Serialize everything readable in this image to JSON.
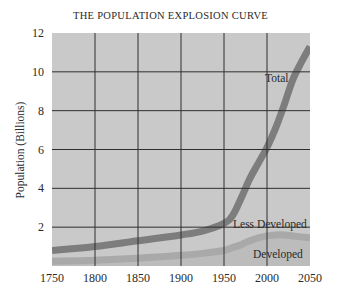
{
  "chart_data": {
    "type": "line",
    "title": "THE POPULATION EXPLOSION CURVE",
    "xlabel": "",
    "ylabel": "Population (Billions)",
    "xlim": [
      1750,
      2050
    ],
    "ylim": [
      0,
      12
    ],
    "x_ticks": [
      1750,
      1800,
      1850,
      1900,
      1950,
      2000,
      2050
    ],
    "y_ticks": [
      2,
      4,
      6,
      8,
      10,
      12
    ],
    "grid": true,
    "x": [
      1750,
      1800,
      1850,
      1900,
      1925,
      1950,
      1960,
      1970,
      1980,
      1990,
      2000,
      2010,
      2020,
      2030,
      2040,
      2050
    ],
    "series": [
      {
        "name": "Total",
        "values": [
          0.8,
          1.0,
          1.3,
          1.6,
          1.8,
          2.2,
          2.6,
          3.5,
          4.5,
          5.3,
          6.1,
          7.1,
          8.3,
          9.6,
          10.5,
          11.3
        ]
      },
      {
        "name": "Less Developed",
        "values": [
          0.5,
          0.7,
          0.9,
          1.0,
          1.1,
          1.4,
          1.8,
          2.5,
          3.3,
          4.1,
          4.9,
          5.8,
          6.9,
          8.1,
          9.0,
          9.8
        ]
      },
      {
        "name": "Developed",
        "values": [
          0.25,
          0.3,
          0.4,
          0.55,
          0.65,
          0.8,
          0.95,
          1.1,
          1.3,
          1.45,
          1.55,
          1.6,
          1.6,
          1.55,
          1.5,
          1.45
        ]
      }
    ],
    "annotations": [
      {
        "text": "Total",
        "x": 2018,
        "y": 9.7
      },
      {
        "text": "Less Developed",
        "x": 1990,
        "y": 2.0
      },
      {
        "text": "Developed",
        "x": 2020,
        "y": 0.6
      }
    ]
  },
  "labels": {
    "title": "THE POPULATION EXPLOSION CURVE",
    "ylabel": "Population (Billions)",
    "total": "Total",
    "less_developed": "Less Developed",
    "developed": "Developed"
  },
  "colors": {
    "plot_bg": "#c9c9c9",
    "grid": "#2e2e2e",
    "total_band": "#7d7d7d",
    "developed_band": "#a9a9a9",
    "below_developed": "#bcbcbc"
  }
}
